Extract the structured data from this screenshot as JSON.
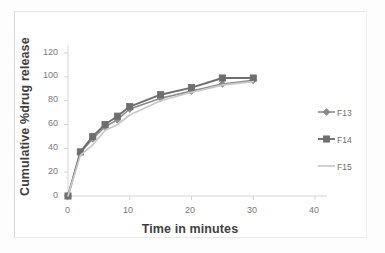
{
  "chart_data": {
    "type": "line",
    "title": "",
    "xlabel": "Time in minutes",
    "ylabel": "Cumulative %drug release",
    "xlim": [
      0,
      40
    ],
    "ylim": [
      0,
      120
    ],
    "xticks": [
      0,
      10,
      20,
      30,
      40
    ],
    "yticks": [
      0,
      20,
      40,
      60,
      80,
      100,
      120
    ],
    "grid": false,
    "legend_position": "right",
    "x": [
      0,
      2,
      4,
      6,
      8,
      10,
      15,
      20,
      25,
      30
    ],
    "series": [
      {
        "name": "F13",
        "marker": "diamond",
        "color": "#8c8c8c",
        "values": [
          0,
          36,
          48,
          58,
          64,
          73,
          82,
          88,
          94,
          97
        ]
      },
      {
        "name": "F14",
        "marker": "square",
        "color": "#6e6e6e",
        "values": [
          0,
          37,
          50,
          60,
          67,
          75,
          85,
          91,
          99,
          99
        ]
      },
      {
        "name": "F15",
        "marker": "line",
        "color": "#c9c9c9",
        "values": [
          0,
          34,
          43,
          55,
          60,
          68,
          80,
          87,
          93,
          96
        ]
      }
    ]
  },
  "axes": {
    "y_tick_labels": [
      "120",
      "100",
      "80",
      "60",
      "40",
      "20",
      "0"
    ],
    "x_tick_labels": [
      "0",
      "10",
      "20",
      "30",
      "40"
    ],
    "y_title": "Cumulative %drug release",
    "x_title": "Time in minutes"
  },
  "legend": {
    "items": [
      {
        "label": "F13",
        "color": "#8c8c8c",
        "marker": "diamond"
      },
      {
        "label": "F14",
        "color": "#6e6e6e",
        "marker": "square"
      },
      {
        "label": "F15",
        "color": "#c9c9c9",
        "marker": "line"
      }
    ]
  }
}
